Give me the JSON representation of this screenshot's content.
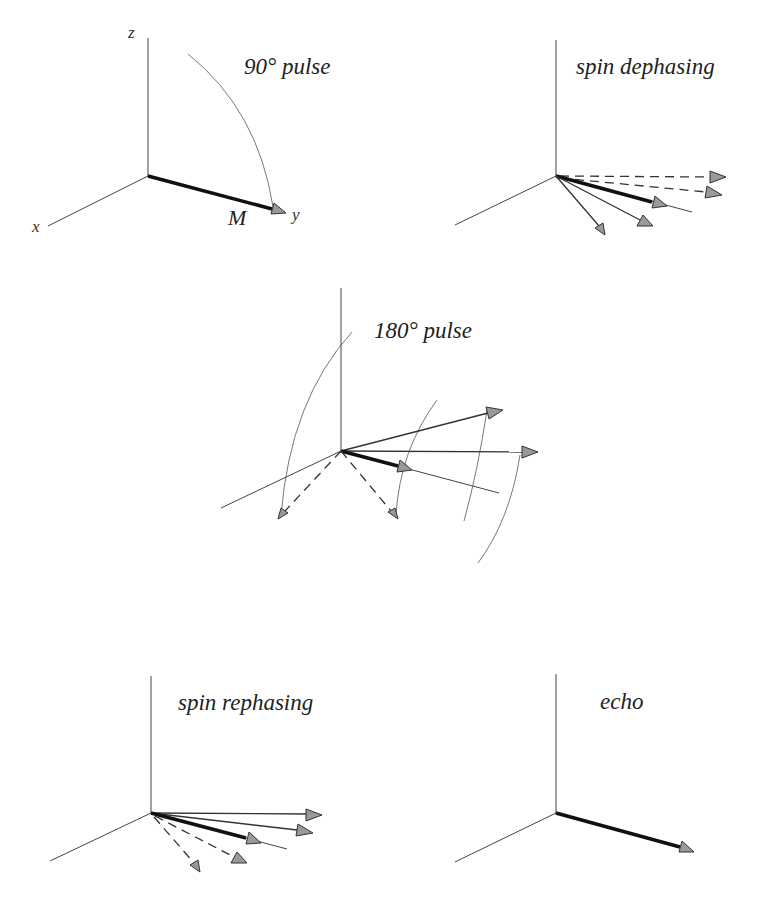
{
  "figure": {
    "panels": [
      {
        "id": "panel-90-pulse",
        "title": "90° pulse",
        "axis_labels": {
          "z": "z",
          "x": "x",
          "y": "y"
        },
        "vector_label": "M"
      },
      {
        "id": "panel-spin-dephasing",
        "title": "spin dephasing"
      },
      {
        "id": "panel-180-pulse",
        "title": "180° pulse"
      },
      {
        "id": "panel-spin-rephasing",
        "title": "spin rephasing"
      },
      {
        "id": "panel-echo",
        "title": "echo"
      }
    ]
  },
  "colors": {
    "background": "#ffffff",
    "line": "#333333",
    "arrowhead_fill": "#999999"
  }
}
